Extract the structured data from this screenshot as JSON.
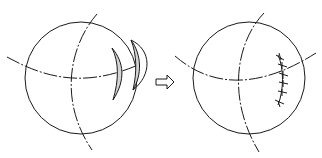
{
  "diagram": {
    "type": "surgical-procedure-illustration",
    "panels": [
      {
        "id": "before",
        "description": "Globe with crescent-shaped wedge excisions of tissue"
      },
      {
        "id": "after",
        "description": "Globe with excision closed by interrupted sutures"
      }
    ],
    "arrow": {
      "direction": "right",
      "style": "hollow"
    },
    "colors": {
      "line": "#1a1a1a",
      "fill": "#d4d4d4",
      "background": "#ffffff"
    },
    "suture_count": 6
  }
}
